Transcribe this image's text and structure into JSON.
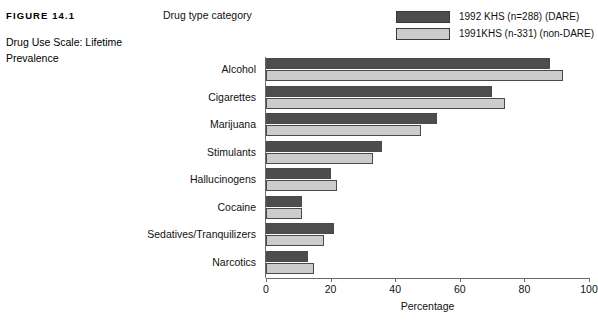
{
  "figure": {
    "number": "FIGURE 14.1",
    "title": "Drug Use Scale: Lifetime Prevalence"
  },
  "axis_title_top": "Drug type category",
  "legend": {
    "items": [
      {
        "label": "1992 KHS (n=288) (DARE)",
        "color": "#4d4d4d"
      },
      {
        "label": "1991KHS (n-331) (non-DARE)",
        "color": "#cccccc"
      }
    ]
  },
  "chart_data": {
    "type": "bar",
    "orientation": "horizontal",
    "title": "Drug Use Scale: Lifetime Prevalence",
    "xlabel": "Percentage",
    "ylabel": "Drug type category",
    "xlim": [
      0,
      100
    ],
    "xticks": [
      0,
      20,
      40,
      60,
      80,
      100
    ],
    "grid": false,
    "legend_position": "top-right",
    "categories": [
      "Alcohol",
      "Cigarettes",
      "Marijuana",
      "Stimulants",
      "Hallucinogens",
      "Cocaine",
      "Sedatives/Tranquilizers",
      "Narcotics"
    ],
    "series": [
      {
        "name": "1992 KHS (n=288) (DARE)",
        "color": "#4d4d4d",
        "values": [
          88,
          70,
          53,
          36,
          20,
          11,
          21,
          13
        ]
      },
      {
        "name": "1991KHS (n-331) (non-DARE)",
        "color": "#cccccc",
        "values": [
          92,
          74,
          48,
          33,
          22,
          11,
          18,
          15
        ]
      }
    ]
  }
}
